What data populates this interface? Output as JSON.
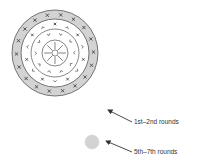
{
  "diagram": {
    "center": {
      "x": 55,
      "y": 53
    },
    "rings": [
      {
        "name": "outer-band",
        "outer_radius": 43,
        "inner_radius": 34,
        "fill": "#d3d3d3",
        "marker": "×",
        "count": 18
      },
      {
        "name": "middle-band",
        "outer_radius": 34,
        "inner_radius": 24,
        "fill": "#ffffff",
        "marker": "×/⌄",
        "count": 14
      },
      {
        "name": "inner-band",
        "outer_radius": 24,
        "inner_radius": 13,
        "fill": "#ffffff",
        "marker": "^",
        "count": 10
      },
      {
        "name": "core",
        "outer_radius": 13,
        "inner_radius": 3,
        "fill": "#ffffff",
        "marker": "spoke",
        "count": 8
      }
    ],
    "small_circle": {
      "x": 92,
      "y": 142,
      "r": 7,
      "fill": "#d3d3d3"
    },
    "stroke_color": "#555555"
  },
  "legend": [
    {
      "label": "1st–2nd rounds",
      "arrow_from": [
        132,
        122
      ],
      "arrow_to": [
        108,
        110
      ],
      "text_x": 134,
      "text_y": 124
    },
    {
      "label": "5th–7th rounds",
      "arrow_from": [
        132,
        152
      ],
      "arrow_to": [
        106,
        141
      ],
      "text_x": 134,
      "text_y": 154
    }
  ]
}
